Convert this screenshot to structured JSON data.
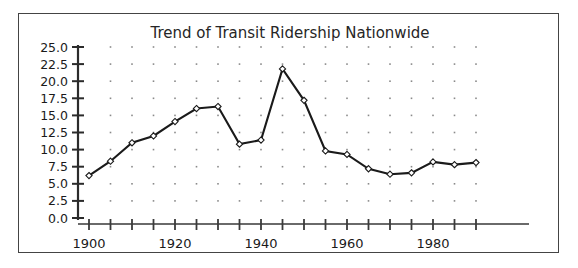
{
  "figure": {
    "background_color": "#ffffff",
    "frame_color": "#444444",
    "line_color": "#1a1a1a",
    "marker_face_color": "#ffffff",
    "grid_dot_color": "#8a8a8a"
  },
  "chart_data": {
    "type": "line",
    "title": "Trend of Transit Ridership Nationwide",
    "xlabel": "",
    "ylabel": "",
    "xlim": [
      1898,
      1992
    ],
    "ylim": [
      0.0,
      25.0
    ],
    "grid": "dotted",
    "legend": null,
    "x": [
      1900,
      1905,
      1910,
      1915,
      1920,
      1925,
      1930,
      1935,
      1940,
      1945,
      1950,
      1955,
      1960,
      1965,
      1970,
      1975,
      1980,
      1985,
      1990
    ],
    "values": [
      6.2,
      8.3,
      11.0,
      12.0,
      14.1,
      16.0,
      16.3,
      10.8,
      11.4,
      21.8,
      17.2,
      9.8,
      9.3,
      7.2,
      6.4,
      6.6,
      8.2,
      7.8,
      8.1
    ],
    "series": [
      {
        "name": "Transit Ridership",
        "values": [
          6.2,
          8.3,
          11.0,
          12.0,
          14.1,
          16.0,
          16.3,
          10.8,
          11.4,
          21.8,
          17.2,
          9.8,
          9.3,
          7.2,
          6.4,
          6.6,
          8.2,
          7.8,
          8.1
        ]
      }
    ],
    "y_ticks": [
      0.0,
      2.5,
      5.0,
      7.5,
      10.0,
      12.5,
      15.0,
      17.5,
      20.0,
      22.5,
      25.0
    ],
    "y_tick_labels": [
      "0.0",
      "2.5",
      "5.0",
      "7.5",
      "10.0",
      "12.5",
      "15.0",
      "17.5",
      "20.0",
      "22.5",
      "25.0"
    ],
    "x_ticks": [
      1900,
      1905,
      1910,
      1915,
      1920,
      1925,
      1930,
      1935,
      1940,
      1945,
      1950,
      1955,
      1960,
      1965,
      1970,
      1975,
      1980,
      1985,
      1990
    ],
    "x_tick_labels": [
      "1900",
      "",
      "",
      "",
      "1920",
      "",
      "",
      "",
      "1940",
      "",
      "",
      "",
      "1960",
      "",
      "",
      "",
      "1980",
      "",
      ""
    ],
    "x_major_labels": [
      "1900",
      "1920",
      "1940",
      "1960",
      "1980"
    ],
    "x_major_positions": [
      1900,
      1920,
      1940,
      1960,
      1980
    ]
  }
}
